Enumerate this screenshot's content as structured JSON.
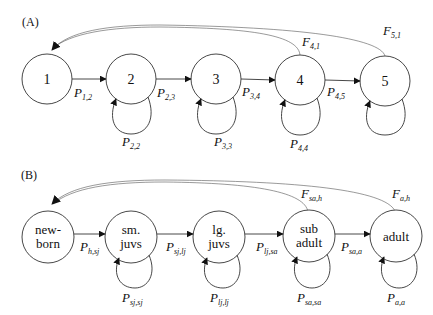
{
  "panels": [
    {
      "id": "A",
      "label": "(A)",
      "nodes": [
        {
          "id": "1",
          "lines": [
            "1"
          ]
        },
        {
          "id": "2",
          "lines": [
            "2"
          ]
        },
        {
          "id": "3",
          "lines": [
            "3"
          ]
        },
        {
          "id": "4",
          "lines": [
            "4"
          ]
        },
        {
          "id": "5",
          "lines": [
            "5"
          ]
        }
      ],
      "transitions": [
        {
          "base": "P",
          "sub": "1,2"
        },
        {
          "base": "P",
          "sub": "2,3"
        },
        {
          "base": "P",
          "sub": "3,4"
        },
        {
          "base": "P",
          "sub": "4,5"
        }
      ],
      "self_loops": [
        {
          "base": "P",
          "sub": "2,2"
        },
        {
          "base": "P",
          "sub": "3,3"
        },
        {
          "base": "P",
          "sub": "4,4"
        }
      ],
      "fecundity": [
        {
          "base": "F",
          "sub": "4,1"
        },
        {
          "base": "F",
          "sub": "5,1"
        }
      ]
    },
    {
      "id": "B",
      "label": "(B)",
      "nodes": [
        {
          "id": "newborn",
          "lines": [
            "new-",
            "born"
          ]
        },
        {
          "id": "sm-juvs",
          "lines": [
            "sm.",
            "juvs"
          ]
        },
        {
          "id": "lg-juvs",
          "lines": [
            "lg.",
            "juvs"
          ]
        },
        {
          "id": "sub-adult",
          "lines": [
            "sub",
            "adult"
          ]
        },
        {
          "id": "adult",
          "lines": [
            "adult"
          ]
        }
      ],
      "transitions": [
        {
          "base": "P",
          "sub": "h,sj"
        },
        {
          "base": "P",
          "sub": "sj,lj"
        },
        {
          "base": "P",
          "sub": "lj,sa"
        },
        {
          "base": "P",
          "sub": "sa,a"
        }
      ],
      "self_loops": [
        {
          "base": "P",
          "sub": "sj,sj"
        },
        {
          "base": "P",
          "sub": "lj,lj"
        },
        {
          "base": "P",
          "sub": "sa,sa"
        },
        {
          "base": "P",
          "sub": "a,a"
        }
      ],
      "fecundity": [
        {
          "base": "F",
          "sub": "sa,h"
        },
        {
          "base": "F",
          "sub": "a,h"
        }
      ]
    }
  ]
}
